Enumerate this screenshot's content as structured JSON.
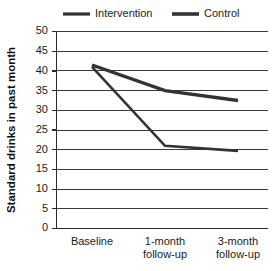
{
  "chart_data": {
    "type": "line",
    "title": "",
    "subtitle": "",
    "xlabel": "",
    "ylabel": "Standard drinks in past month",
    "categories": [
      "Baseline",
      "1-month follow-up",
      "3-month follow-up"
    ],
    "x": [
      0,
      1,
      2
    ],
    "series": [
      {
        "name": "Intervention",
        "values": [
          41,
          21,
          19.7
        ],
        "color": "#333333"
      },
      {
        "name": "Control",
        "values": [
          41.5,
          35,
          32.5
        ],
        "color": "#333333"
      }
    ],
    "ylim": [
      0,
      50
    ],
    "ytick_values": [
      0,
      5,
      10,
      15,
      20,
      25,
      30,
      35,
      40,
      45,
      50
    ],
    "ytick_labels": [
      "0",
      "5",
      "10",
      "15",
      "20",
      "25",
      "30",
      "35",
      "40",
      "45",
      "50"
    ],
    "grid": true,
    "grid_axis": "y",
    "legend_position": "top",
    "legend": [
      "Intervention",
      "Control"
    ],
    "background_color": "#ffffff"
  },
  "axis": {
    "y_title": "Standard drinks in past month",
    "y_labels": {
      "t0": "0",
      "t5": "5",
      "t10": "10",
      "t15": "15",
      "t20": "20",
      "t25": "25",
      "t30": "30",
      "t35": "35",
      "t40": "40",
      "t45": "45",
      "t50": "50"
    },
    "x_labels": {
      "c0_line1": "Baseline",
      "c0_line2": "",
      "c1_line1": "1-month",
      "c1_line2": "follow-up",
      "c2_line1": "3-month",
      "c2_line2": "follow-up"
    }
  },
  "legend": {
    "intervention_label": "Intervention",
    "control_label": "Control"
  }
}
